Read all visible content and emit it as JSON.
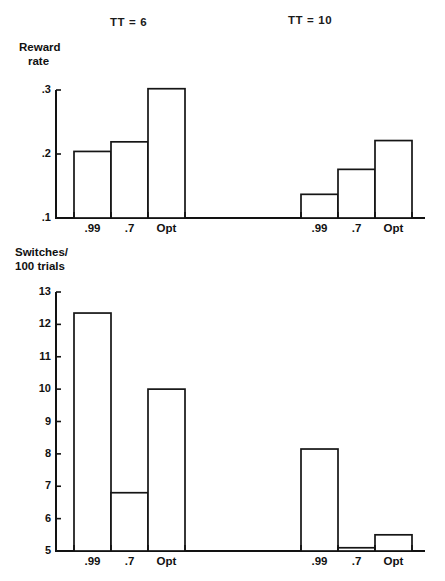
{
  "figure": {
    "group_titles": [
      {
        "id": "tt6",
        "label": "TT = 6"
      },
      {
        "id": "tt10",
        "label": "TT = 10"
      }
    ]
  },
  "chart_data": [
    {
      "type": "bar",
      "id": "reward-rate",
      "title": "",
      "ylabel_line1": "Reward",
      "ylabel_line2": "rate",
      "xlabel": "",
      "ylim": [
        0.1,
        0.3
      ],
      "yticks": [
        0.1,
        0.2,
        0.3
      ],
      "ytick_labels": [
        ".1",
        ".2",
        ".3"
      ],
      "grid": false,
      "legend": "none",
      "categories": [
        ".99",
        ".7",
        "Opt"
      ],
      "groups": [
        "TT = 6",
        "TT = 10"
      ],
      "series": [
        {
          "name": "TT = 6",
          "values": [
            0.204,
            0.219,
            0.302
          ]
        },
        {
          "name": "TT = 10",
          "values": [
            0.137,
            0.176,
            0.221
          ]
        }
      ]
    },
    {
      "type": "bar",
      "id": "switches-per-100-trials",
      "title": "",
      "ylabel_line1": "Switches/",
      "ylabel_line2": "100 trials",
      "xlabel": "",
      "ylim": [
        5,
        13
      ],
      "yticks": [
        5,
        6,
        7,
        8,
        9,
        10,
        11,
        12,
        13
      ],
      "ytick_labels": [
        "5",
        "6",
        "7",
        "8",
        "9",
        "10",
        "11",
        "12",
        "13"
      ],
      "grid": false,
      "legend": "none",
      "categories": [
        ".99",
        ".7",
        "Opt"
      ],
      "groups": [
        "TT = 6",
        "TT = 10"
      ],
      "series": [
        {
          "name": "TT = 6",
          "values": [
            12.35,
            6.8,
            10.0
          ]
        },
        {
          "name": "TT = 10",
          "values": [
            8.15,
            5.1,
            5.5
          ]
        }
      ]
    }
  ],
  "colors": {
    "ink": "#121212",
    "bar_fill": "#ffffff",
    "background": "#ffffff"
  }
}
